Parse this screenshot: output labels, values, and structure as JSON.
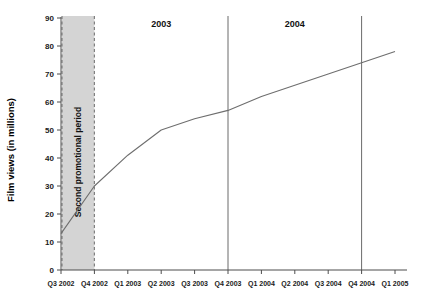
{
  "chart_data": {
    "type": "line",
    "title": "",
    "xlabel": "",
    "ylabel": "Film views (in millions)",
    "ylim": [
      0,
      90
    ],
    "ytick_step": 10,
    "yticks": [
      0,
      10,
      20,
      30,
      40,
      50,
      60,
      70,
      80,
      90
    ],
    "grid": false,
    "legend": "none",
    "categories": [
      "Q3 2002",
      "Q4 2002",
      "Q1 2003",
      "Q2 2003",
      "Q3 2003",
      "Q4 2003",
      "Q1 2004",
      "Q2 2004",
      "Q3 2004",
      "Q4 2004",
      "Q1 2005"
    ],
    "series": [
      {
        "name": "Film views",
        "values": [
          13,
          30,
          41,
          50,
          54,
          57,
          62,
          66,
          70,
          74,
          78
        ]
      }
    ],
    "annotations": {
      "shaded_band": {
        "label": "Second promotional period",
        "from": "Q3 2002",
        "to": "Q4 2002",
        "fill": "#d4d4d4",
        "border_style": "dashed",
        "border_color": "#808080"
      },
      "year_dividers": [
        {
          "label": "2003",
          "start": "Q4 2002",
          "end": "Q4 2003"
        },
        {
          "label": "2004",
          "start": "Q4 2003",
          "end": "Q4 2004"
        }
      ],
      "divider_positions": [
        "Q4 2003",
        "Q4 2004"
      ]
    },
    "colors": {
      "line": "#6e6e6e",
      "axis": "#4d4d4d",
      "band_fill": "#d4d4d4",
      "band_border": "#808080",
      "divider": "#6b6b6b",
      "text": "#111111"
    }
  }
}
